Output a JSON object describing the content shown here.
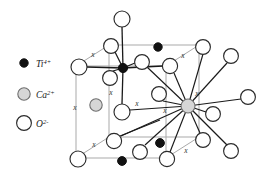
{
  "figure": {
    "background_color": "#ffffff"
  },
  "legend": {
    "items": [
      {
        "id": "ti",
        "symbol": "Ti",
        "charge": "4+",
        "label": "Ti",
        "full_label": "Ti 4+",
        "marker": "filled-black-circle",
        "fill": "#111111",
        "stroke": "#111111",
        "radius": 4.2
      },
      {
        "id": "ca",
        "symbol": "Ca",
        "charge": "2+",
        "label": "Ca",
        "full_label": "Ca 2+",
        "marker": "gray-filled-circle",
        "fill": "#d6d6d6",
        "stroke": "#6e6e6e",
        "radius": 6.2
      },
      {
        "id": "o",
        "symbol": "O",
        "charge": "2-",
        "label": "O",
        "full_label": "O 2-",
        "marker": "open-white-circle",
        "fill": "#ffffff",
        "stroke": "#2b2b2b",
        "radius": 7.4
      }
    ]
  },
  "colors": {
    "cell_edge": "#a9a9a9",
    "bond": "#1a1a1a",
    "oxygen_stroke": "#2b2b2b",
    "oxygen_fill": "#ffffff",
    "titanium_fill": "#111111",
    "calcium_fill": "#d6d6d6",
    "calcium_stroke": "#6e6e6e",
    "text": "#1a1a1a"
  },
  "bond_label": "x",
  "bond_labels": [
    {
      "id": "bl1",
      "text": "x",
      "x": 93,
      "y": 57
    },
    {
      "id": "bl2",
      "text": "x",
      "x": 183,
      "y": 58
    },
    {
      "id": "bl3",
      "text": "x",
      "x": 111,
      "y": 95
    },
    {
      "id": "bl4",
      "text": "x",
      "x": 137,
      "y": 106
    },
    {
      "id": "bl5",
      "text": "x",
      "x": 197,
      "y": 96
    },
    {
      "id": "bl6",
      "text": "x",
      "x": 75,
      "y": 110
    },
    {
      "id": "bl7",
      "text": "x",
      "x": 165,
      "y": 113
    },
    {
      "id": "bl8",
      "text": "x",
      "x": 94,
      "y": 147
    },
    {
      "id": "bl9",
      "text": "x",
      "x": 186,
      "y": 153
    }
  ],
  "unit_cell": {
    "description": "Pseudo-cubic unit cell drawn in perspective",
    "front_face": [
      {
        "x": 76,
        "y": 66
      },
      {
        "x": 166,
        "y": 66
      },
      {
        "x": 166,
        "y": 158
      },
      {
        "x": 76,
        "y": 158
      }
    ],
    "back_face": [
      {
        "x": 109,
        "y": 45
      },
      {
        "x": 199,
        "y": 45
      },
      {
        "x": 199,
        "y": 137
      },
      {
        "x": 109,
        "y": 137
      }
    ]
  },
  "atoms": [
    {
      "id": "o-top-apex",
      "species": "o",
      "x": 122,
      "y": 19,
      "r": 8.0
    },
    {
      "id": "o-back-left-t",
      "species": "o",
      "x": 111,
      "y": 46,
      "r": 7.4
    },
    {
      "id": "ti-top-back",
      "species": "ti",
      "x": 158,
      "y": 47,
      "r": 4.2
    },
    {
      "id": "o-back-right-t",
      "species": "o",
      "x": 203,
      "y": 47,
      "r": 7.4
    },
    {
      "id": "o-left-mid-t",
      "species": "o",
      "x": 79,
      "y": 67,
      "r": 8.0
    },
    {
      "id": "ti-center-top",
      "species": "ti",
      "x": 123,
      "y": 68,
      "r": 4.6
    },
    {
      "id": "o-inner-top",
      "species": "o",
      "x": 142,
      "y": 62,
      "r": 7.4
    },
    {
      "id": "o-right-mid-t",
      "species": "o",
      "x": 170,
      "y": 66,
      "r": 7.6
    },
    {
      "id": "o-far-right-t",
      "species": "o",
      "x": 231,
      "y": 56,
      "r": 7.4
    },
    {
      "id": "o-below-ti",
      "species": "o",
      "x": 110,
      "y": 78,
      "r": 7.4
    },
    {
      "id": "ca-left-in",
      "species": "ca",
      "x": 96,
      "y": 105,
      "r": 6.2
    },
    {
      "id": "o-mid-inner",
      "species": "o",
      "x": 159,
      "y": 94,
      "r": 7.4
    },
    {
      "id": "o-center-low",
      "species": "o",
      "x": 122,
      "y": 112,
      "r": 8.0
    },
    {
      "id": "ca-center",
      "species": "ca",
      "x": 188,
      "y": 106,
      "r": 7.0
    },
    {
      "id": "o-right-ca",
      "species": "o",
      "x": 213,
      "y": 114,
      "r": 7.4
    },
    {
      "id": "o-far-right-m",
      "species": "o",
      "x": 248,
      "y": 97,
      "r": 7.4
    },
    {
      "id": "o-far-right-u",
      "species": "o",
      "x": 231,
      "y": 57,
      "r": 0.0
    },
    {
      "id": "o-front-left-b",
      "species": "o",
      "x": 114,
      "y": 141,
      "r": 7.6
    },
    {
      "id": "ti-front-low",
      "species": "ti",
      "x": 160,
      "y": 143,
      "r": 4.4
    },
    {
      "id": "o-back-right-b",
      "species": "o",
      "x": 203,
      "y": 140,
      "r": 7.4
    },
    {
      "id": "o-inner-bot",
      "species": "o",
      "x": 140,
      "y": 152,
      "r": 7.4
    },
    {
      "id": "o-left-bot",
      "species": "o",
      "x": 78,
      "y": 159,
      "r": 8.0
    },
    {
      "id": "ti-bottom",
      "species": "ti",
      "x": 122,
      "y": 161,
      "r": 4.4
    },
    {
      "id": "o-front-bot-r",
      "species": "o",
      "x": 167,
      "y": 159,
      "r": 7.6
    },
    {
      "id": "o-far-right-b",
      "species": "o",
      "x": 231,
      "y": 151,
      "r": 7.4
    }
  ],
  "bonds": {
    "titanium_octahedral": [
      [
        "ti-center-top",
        "o-top-apex"
      ],
      [
        "ti-center-top",
        "o-left-mid-t"
      ],
      [
        "ti-center-top",
        "o-back-left-t"
      ],
      [
        "ti-center-top",
        "o-inner-top"
      ],
      [
        "ti-center-top",
        "o-below-ti"
      ],
      [
        "ti-center-top",
        "o-right-mid-t"
      ],
      [
        "ti-center-top",
        "o-center-low"
      ]
    ],
    "calcium_dodecahedral": [
      [
        "ca-center",
        "o-back-right-t"
      ],
      [
        "ca-center",
        "o-far-right-t"
      ],
      [
        "ca-center",
        "o-right-mid-t"
      ],
      [
        "ca-center",
        "o-mid-inner"
      ],
      [
        "ca-center",
        "o-inner-top"
      ],
      [
        "ca-center",
        "o-center-low"
      ],
      [
        "ca-center",
        "o-far-right-m"
      ],
      [
        "ca-center",
        "o-right-ca"
      ],
      [
        "ca-center",
        "o-back-right-b"
      ],
      [
        "ca-center",
        "o-far-right-b"
      ],
      [
        "ca-center",
        "o-front-bot-r"
      ],
      [
        "ca-center",
        "o-inner-bot"
      ],
      [
        "ca-center",
        "o-front-left-b"
      ]
    ]
  }
}
